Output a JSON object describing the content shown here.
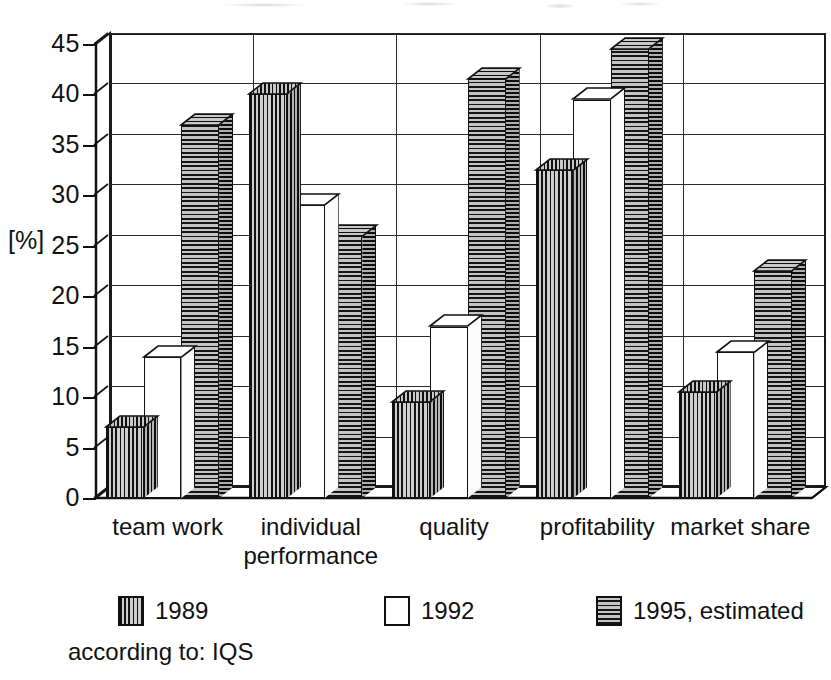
{
  "chart_data": {
    "type": "bar",
    "title": "",
    "subtitle": "",
    "xlabel": "",
    "ylabel": "[%]",
    "ylim": [
      0,
      45
    ],
    "ytick_step": 5,
    "yticks": [
      0,
      5,
      10,
      15,
      20,
      25,
      30,
      35,
      40,
      45
    ],
    "ytick_labels": [
      "0",
      "5",
      "10",
      "15",
      "20",
      "25",
      "30",
      "35",
      "40",
      "45"
    ],
    "grid": "horizontal-and-group-separators",
    "legend_position": "bottom",
    "style": "3d-grouped-bars-black-and-white-hatched",
    "categories": [
      "team work",
      "individual performance",
      "quality",
      "profitability",
      "market share"
    ],
    "category_label_lines": [
      [
        "team work"
      ],
      [
        "individual",
        "performance"
      ],
      [
        "quality"
      ],
      [
        "profitability"
      ],
      [
        "market share"
      ]
    ],
    "series": [
      {
        "name": "1989",
        "pattern": "vertical-hatch",
        "values": [
          7,
          40,
          9.5,
          32.5,
          10.5
        ]
      },
      {
        "name": "1992",
        "pattern": "blank-white",
        "values": [
          14,
          29,
          17,
          39.5,
          14.5
        ]
      },
      {
        "name": "1995, estimated",
        "pattern": "horizontal-hatch",
        "values": [
          37,
          26,
          41.5,
          44.5,
          22.5
        ]
      }
    ],
    "annotations": [
      "according to: IQS"
    ]
  },
  "axis": {
    "unit_label": "[%]",
    "tick_labels": [
      "45",
      "40",
      "35",
      "30",
      "25",
      "20",
      "15",
      "10",
      "5",
      "0"
    ]
  },
  "legend": {
    "items": [
      {
        "label": "1989",
        "pattern": "vertical-hatch"
      },
      {
        "label": "1992",
        "pattern": "blank-white"
      },
      {
        "label": "1995, estimated",
        "pattern": "horizontal-hatch"
      }
    ]
  },
  "source": {
    "note": "according to: IQS"
  },
  "colors": {
    "ink": "#111111",
    "paper": "#ffffff",
    "hatch_dark": "#121212",
    "hatch_light": "#cccccc"
  }
}
